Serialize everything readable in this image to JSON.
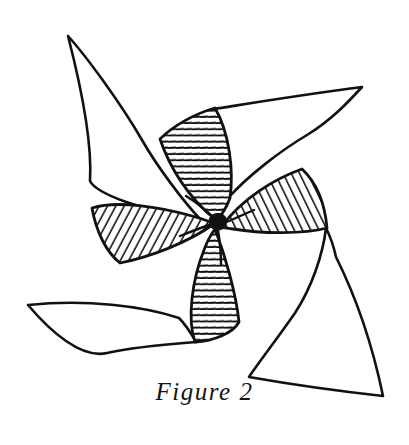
{
  "figure": {
    "caption": "Figure 2",
    "background_color": "#ffffff",
    "ink_color": "#111111",
    "hub": {
      "label": "center-hub",
      "cx": 218,
      "cy": 222,
      "r": 7.5,
      "fill": "#111111"
    },
    "blade_count": 4,
    "tips": [
      {
        "name": "upper-left-tip",
        "x": 68,
        "y": 36
      },
      {
        "name": "upper-right-tip",
        "x": 362,
        "y": 87
      },
      {
        "name": "lower-right-tip",
        "x": 383,
        "y": 396
      },
      {
        "name": "lower-left-tip",
        "x": 28,
        "y": 305
      }
    ],
    "blades": [
      {
        "name": "blade-upper-left",
        "sail_path": "M68,36 C84,96 92,150 90,182 C100,196 150,214 214,220 C190,198 160,160 140,130 C118,98 88,58 68,36 Z",
        "sail_fill": "#ffffff",
        "shadow_name": "shadow-top",
        "shadow_path": "M214,218 C186,196 170,166 162,140 C176,128 196,116 216,110 C228,132 232,168 228,196 C224,206 220,214 214,218 Z",
        "hatch": "horizontal"
      },
      {
        "name": "blade-upper-right",
        "sail_path": "M362,87 C304,96 256,104 216,110 C210,128 216,170 228,196 C246,176 278,152 306,136 C332,120 350,100 362,87 Z",
        "sail_fill": "#ffffff",
        "shadow_name": "shadow-right",
        "shadow_path": "M220,226 C242,198 272,180 300,170 C314,182 322,204 324,226 C302,232 262,232 232,228 C226,228 222,227 220,226 Z",
        "hatch": "diagonal-right"
      },
      {
        "name": "blade-lower-right",
        "sail_path": "M383,396 C370,338 350,288 334,256 C332,240 328,232 324,226 C322,252 312,286 294,312 C276,338 258,362 248,376 C282,382 346,392 383,396 Z",
        "sail_fill": "#ffffff",
        "shadow_name": "shadow-bottom",
        "shadow_path": "M216,228 C226,254 236,292 238,320 C232,330 214,338 196,340 C188,318 192,280 204,250 C208,240 212,232 216,228 Z",
        "hatch": "horizontal"
      },
      {
        "name": "blade-lower-left",
        "sail_path": "M28,305 C86,300 142,306 178,318 C186,326 192,334 196,340 C170,342 134,346 108,352 C82,358 50,330 28,305 Z",
        "sail_fill": "#ffffff",
        "shadow_name": "shadow-left",
        "shadow_path": "M214,224 C188,242 152,256 122,262 C108,252 98,232 94,210 C118,202 160,208 192,216 C202,219 210,222 214,224 Z",
        "hatch": "diagonal-left"
      }
    ],
    "hatch_styles": {
      "horizontal": "near-horizontal parallel rule lines",
      "diagonal-right": "parallel rule lines tilted about 65 degrees",
      "diagonal-left": "parallel rule lines tilted about minus 65 degrees"
    }
  }
}
